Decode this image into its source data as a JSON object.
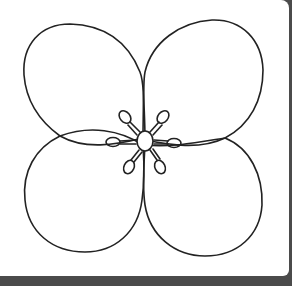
{
  "image": {
    "subject": "four-petal-flower-line-drawing",
    "alt": "Coloring page: four-petal flower outline with stamens in the center",
    "colors": {
      "background": "#4b4b4b",
      "paper": "#ffffff",
      "line": "#222222"
    },
    "petal_count": 4,
    "stamen_count": 6
  }
}
